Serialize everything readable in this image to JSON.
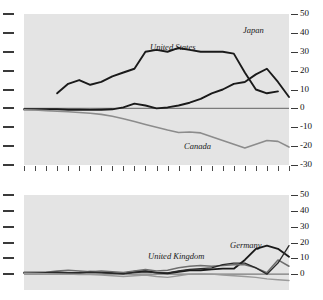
{
  "figure": {
    "title_partial": "",
    "background": "#ffffff",
    "plot_background": "#e4e4e4"
  },
  "chart_data": [
    {
      "type": "line",
      "panel": "top",
      "title": "",
      "xlabel": "",
      "ylabel": "",
      "ylim": [
        -30,
        50
      ],
      "yticks": [
        50,
        40,
        30,
        20,
        10,
        0,
        -10,
        -20,
        -30
      ],
      "ytick_labels": [
        "50",
        "40",
        "30",
        "20",
        "10",
        "0",
        "-10",
        "-20",
        "-30"
      ],
      "y_axis_position": "right",
      "grid": false,
      "zero_line": true,
      "n_xticks": 25,
      "x": [
        0,
        1,
        2,
        3,
        4,
        5,
        6,
        7,
        8,
        9,
        10,
        11,
        12,
        13,
        14,
        15,
        16,
        17,
        18,
        19,
        20,
        21,
        22,
        23,
        24
      ],
      "series": [
        {
          "name": "United States",
          "color": "#1a1a1a",
          "width": 1.9,
          "label_x": 150,
          "label_y": 42,
          "start_index": 3,
          "values": [
            null,
            null,
            null,
            8,
            13,
            15,
            12.5,
            14,
            17,
            19,
            21,
            30,
            31,
            30,
            32,
            31,
            30,
            30,
            30,
            29,
            19,
            10,
            8,
            9,
            null
          ]
        },
        {
          "name": "Japan",
          "color": "#1a1a1a",
          "width": 1.9,
          "label_x": 243,
          "label_y": 25,
          "start_index": 0,
          "values": [
            -0.5,
            -0.5,
            -0.5,
            -0.5,
            -0.7,
            -0.7,
            -0.8,
            -0.7,
            -0.5,
            0.5,
            2.5,
            1.5,
            0,
            0.5,
            1.5,
            3,
            5,
            8,
            10,
            13,
            14,
            18,
            21,
            14,
            6
          ]
        },
        {
          "name": "Canada",
          "color": "#8c8c8c",
          "width": 1.6,
          "label_x": 184,
          "label_y": 141,
          "start_index": 0,
          "values": [
            -0.7,
            -0.9,
            -1.2,
            -1.5,
            -1.8,
            -2.2,
            -2.6,
            -3.2,
            -4.2,
            -5.5,
            -7,
            -8.5,
            -10,
            -11.5,
            -12.8,
            -12.5,
            -13,
            -15,
            -17,
            -19,
            -21,
            -19,
            -17,
            -17.5,
            -20.5
          ]
        }
      ]
    },
    {
      "type": "line",
      "panel": "bottom",
      "title": "",
      "xlabel": "",
      "ylabel": "",
      "ylim": [
        -10,
        50
      ],
      "yticks": [
        50,
        40,
        30,
        20,
        10,
        0
      ],
      "ytick_labels": [
        "50",
        "40",
        "30",
        "20",
        "10",
        "0"
      ],
      "y_axis_position": "right",
      "grid": false,
      "zero_line": true,
      "n_xticks": 25,
      "x": [
        0,
        1,
        2,
        3,
        4,
        5,
        6,
        7,
        8,
        9,
        10,
        11,
        12,
        13,
        14,
        15,
        16,
        17,
        18,
        19,
        20,
        21,
        22,
        23,
        24
      ],
      "series": [
        {
          "name": "Germany",
          "color": "#1a1a1a",
          "width": 1.9,
          "label_x": 230,
          "label_y": 240,
          "start_index": 0,
          "values": [
            1,
            1,
            1,
            1,
            0.8,
            1,
            1.5,
            1.2,
            0.8,
            0.5,
            1.5,
            2,
            1,
            0.5,
            1.5,
            2.5,
            2.5,
            3,
            3.5,
            3.5,
            9,
            16,
            18,
            16,
            11
          ]
        },
        {
          "name": "United Kingdom",
          "color": "#6e6e6e",
          "width": 1.5,
          "label_x": 148,
          "label_y": 251,
          "start_index": 0,
          "values": [
            1,
            1,
            1.2,
            2,
            2.5,
            2,
            1.5,
            2,
            1.5,
            1,
            2,
            3,
            2,
            2.5,
            4,
            5,
            5.5,
            5,
            5.5,
            6,
            6,
            4,
            1,
            9,
            5
          ]
        },
        {
          "name": "series-3",
          "color": "#2a2a2a",
          "width": 1.3,
          "start_index": 0,
          "values": [
            0.5,
            0.8,
            1,
            1.2,
            1,
            0.8,
            1.2,
            1,
            0.5,
            0.2,
            1,
            1.5,
            1,
            0.8,
            2,
            3,
            3.5,
            4,
            6,
            7,
            7,
            4,
            0,
            7,
            18
          ]
        },
        {
          "name": "series-4",
          "color": "#9a9a9a",
          "width": 1.4,
          "start_index": 0,
          "values": [
            0.5,
            0.5,
            0.3,
            0.2,
            0,
            -0.2,
            -0.3,
            -0.5,
            -1,
            -1.5,
            -1,
            -0.5,
            -1.5,
            -2,
            -1,
            0,
            0.2,
            0,
            -0.5,
            -1,
            -1.5,
            -2,
            -3,
            -3.5,
            -4
          ]
        }
      ]
    }
  ]
}
